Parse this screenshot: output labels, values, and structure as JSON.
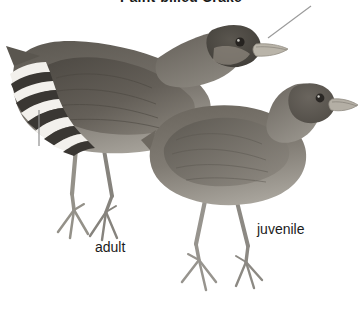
{
  "plate": {
    "title": "Paint-billed Crake",
    "background_color": "#ffffff",
    "title_color": "#1a1a1a",
    "caption_color": "#1b1b1b"
  },
  "figures": [
    {
      "id": "adult",
      "label": "adult",
      "label_position": {
        "x": 95,
        "y": 239
      },
      "posture": "standing, facing right, head lowered and extended forward",
      "plumage": {
        "upperparts_color": "#6f6a63",
        "underparts_color": "#9a968e",
        "crown_color": "#4e4a45",
        "wing_color": "#5d5952",
        "flank_barring": "bold black-and-white barring on rear flanks and undertail",
        "bar_light_color": "#f2f0ec",
        "bar_dark_color": "#3a3733"
      },
      "bill_color": "#b9b4a9",
      "leg_color": "#8d8a84",
      "eye_color": "#262320"
    },
    {
      "id": "juvenile",
      "label": "juvenile",
      "label_position": {
        "x": 257,
        "y": 221
      },
      "posture": "standing, facing right, neck upright",
      "plumage": {
        "upperparts_color": "#7b766e",
        "underparts_color": "#9e9a92",
        "crown_color": "#5e5a54",
        "wing_color": "#6e6a62",
        "flank_barring": "none — plain unmarked flanks",
        "bar_light_color": "#ffffff",
        "bar_dark_color": "#7b766e"
      },
      "bill_color": "#b4afa5",
      "leg_color": "#928f89",
      "eye_color": "#2a2724"
    }
  ],
  "leader_lines": [
    {
      "id": "bill-leader",
      "points_to": "adult bill",
      "x1": 268,
      "y1": 38,
      "x2": 311,
      "y2": 6,
      "color": "#9b9b9b"
    },
    {
      "id": "flank-leader",
      "points_to": "adult barred flank",
      "x1": 39,
      "y1": 110,
      "x2": 39,
      "y2": 146,
      "color": "#8e8e8e"
    }
  ]
}
